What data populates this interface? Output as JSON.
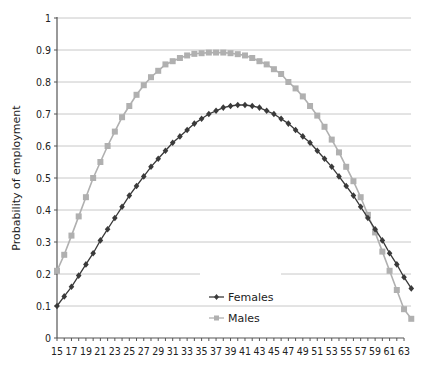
{
  "chart_data": {
    "type": "line",
    "title": "",
    "xlabel": "",
    "ylabel": "Probability of employment",
    "ylim": [
      0,
      1
    ],
    "yticks": [
      0,
      0.1,
      0.2,
      0.3,
      0.4,
      0.5,
      0.6,
      0.7,
      0.8,
      0.9,
      1
    ],
    "ytick_labels": [
      "0",
      "0.1",
      "0.2",
      "0.3",
      "0.4",
      "0.5",
      "0.6",
      "0.7",
      "0.8",
      "0.9",
      "1"
    ],
    "xtick_labels": [
      "15",
      "17",
      "19",
      "21",
      "23",
      "25",
      "27",
      "29",
      "31",
      "33",
      "35",
      "37",
      "39",
      "41",
      "43",
      "45",
      "47",
      "49",
      "51",
      "53",
      "55",
      "57",
      "59",
      "61",
      "63"
    ],
    "grid": "horizontal",
    "legend_position": "lower center",
    "x": [
      15,
      16,
      17,
      18,
      19,
      20,
      21,
      22,
      23,
      24,
      25,
      26,
      27,
      28,
      29,
      30,
      31,
      32,
      33,
      34,
      35,
      36,
      37,
      38,
      39,
      40,
      41,
      42,
      43,
      44,
      45,
      46,
      47,
      48,
      49,
      50,
      51,
      52,
      53,
      54,
      55,
      56,
      57,
      58,
      59,
      60,
      61,
      62,
      63,
      64
    ],
    "series": [
      {
        "name": "Females",
        "color": "#3a3a3a",
        "marker": "diamond",
        "values": [
          0.1,
          0.13,
          0.16,
          0.195,
          0.23,
          0.265,
          0.305,
          0.34,
          0.375,
          0.41,
          0.445,
          0.475,
          0.505,
          0.535,
          0.56,
          0.585,
          0.61,
          0.63,
          0.65,
          0.67,
          0.685,
          0.7,
          0.71,
          0.72,
          0.725,
          0.728,
          0.728,
          0.725,
          0.72,
          0.71,
          0.7,
          0.685,
          0.67,
          0.65,
          0.63,
          0.61,
          0.585,
          0.56,
          0.535,
          0.505,
          0.475,
          0.445,
          0.41,
          0.375,
          0.34,
          0.305,
          0.265,
          0.23,
          0.19,
          0.155
        ]
      },
      {
        "name": "Males",
        "color": "#b0b0b0",
        "marker": "square",
        "values": [
          0.21,
          0.26,
          0.32,
          0.38,
          0.44,
          0.5,
          0.55,
          0.6,
          0.645,
          0.69,
          0.725,
          0.76,
          0.79,
          0.815,
          0.835,
          0.855,
          0.865,
          0.875,
          0.883,
          0.888,
          0.89,
          0.892,
          0.892,
          0.892,
          0.89,
          0.887,
          0.883,
          0.875,
          0.865,
          0.855,
          0.84,
          0.825,
          0.8,
          0.78,
          0.755,
          0.725,
          0.695,
          0.66,
          0.62,
          0.58,
          0.535,
          0.49,
          0.44,
          0.385,
          0.33,
          0.27,
          0.21,
          0.15,
          0.09,
          0.06
        ]
      }
    ]
  }
}
